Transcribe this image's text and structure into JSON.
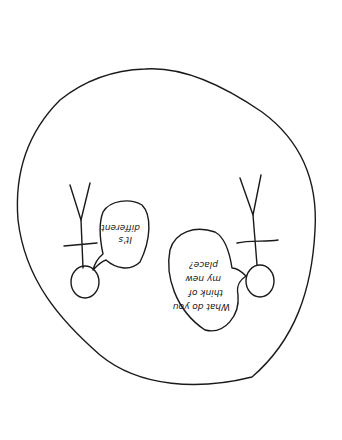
{
  "sketch": {
    "description": "Hand-drawn sketch shown upside down: a large oval enclosing two stick figures with speech bubbles",
    "orientation": "rotated 180 degrees",
    "ink_color": "#1a1a1a",
    "background": "#ffffff",
    "figures": [
      {
        "id": "left-figure",
        "speech": {
          "lines": [
            "It's",
            "different"
          ]
        }
      },
      {
        "id": "right-figure",
        "speech": {
          "lines": [
            "What do you",
            "think of",
            "my new",
            "place?"
          ]
        }
      }
    ]
  }
}
